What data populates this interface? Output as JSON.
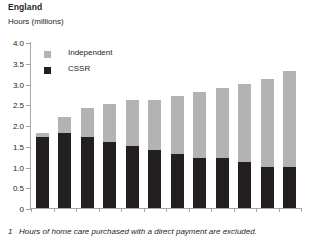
{
  "region_title": "England",
  "axis_unit_label": "Hours (millions)",
  "legend": {
    "position": "inside-top-left",
    "items": [
      {
        "label": "Independent",
        "color": "#b3b3b3",
        "swatch_name": "legend-swatch-independent"
      },
      {
        "label": "CSSR",
        "color": "#231f20",
        "swatch_name": "legend-swatch-cssr"
      }
    ]
  },
  "footnote": {
    "marker": "1",
    "text": "Hours of home care purchased with a direct payment are excluded."
  },
  "chart_data": {
    "type": "bar",
    "stacked": true,
    "title": "England",
    "xlabel": "",
    "ylabel": "Hours (millions)",
    "ylim": [
      0,
      4.0
    ],
    "ytick_labels": [
      "0",
      "0.5",
      "1.0",
      "1.5",
      "2.0",
      "2.5",
      "3.0",
      "3.5",
      "4.0"
    ],
    "ytick_values": [
      0,
      0.5,
      1.0,
      1.5,
      2.0,
      2.5,
      3.0,
      3.5,
      4.0
    ],
    "grid": false,
    "categories": [
      "1993",
      "1994",
      "1995",
      "1996",
      "1997",
      "1998",
      "1999",
      "2000",
      "2001",
      "2002",
      "2003",
      "2004"
    ],
    "series": [
      {
        "name": "CSSR",
        "color": "#231f20",
        "values": [
          1.7,
          1.8,
          1.7,
          1.6,
          1.5,
          1.4,
          1.3,
          1.2,
          1.2,
          1.1,
          1.0,
          1.0
        ]
      },
      {
        "name": "Independent",
        "color": "#b3b3b3",
        "values": [
          0.1,
          0.4,
          0.7,
          0.9,
          1.1,
          1.2,
          1.4,
          1.6,
          1.7,
          1.9,
          2.1,
          2.3
        ]
      }
    ],
    "totals": [
      1.8,
      2.2,
      2.4,
      2.5,
      2.6,
      2.6,
      2.7,
      2.8,
      2.9,
      3.0,
      3.1,
      3.3
    ]
  }
}
